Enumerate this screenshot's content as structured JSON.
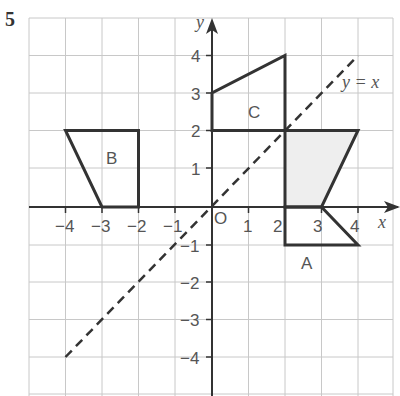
{
  "question_number": "5",
  "diagram": {
    "x_axis_label": "x",
    "y_axis_label": "y",
    "origin_label": "O",
    "x_ticks": [
      "−4",
      "−3",
      "−2",
      "−1",
      "1",
      "2",
      "3",
      "4"
    ],
    "y_ticks": [
      "4",
      "3",
      "2",
      "1",
      "−1",
      "−2",
      "−3",
      "−4"
    ],
    "line_label": "y = x",
    "shapes": [
      {
        "name": "A",
        "vertices": [
          [
            2,
            0
          ],
          [
            3,
            0
          ],
          [
            4,
            -2
          ],
          [
            2,
            -2
          ]
        ]
      },
      {
        "name": "B",
        "vertices": [
          [
            -4,
            2
          ],
          [
            -2,
            2
          ],
          [
            -2,
            0
          ],
          [
            -3,
            0
          ]
        ]
      },
      {
        "name": "C",
        "vertices": [
          [
            0,
            2
          ],
          [
            0,
            3
          ],
          [
            2,
            4
          ],
          [
            2,
            2
          ]
        ]
      },
      {
        "name": "shaded",
        "vertices": [
          [
            2,
            0
          ],
          [
            3,
            0
          ],
          [
            4,
            2
          ],
          [
            2,
            2
          ]
        ],
        "fill": "#eeeeee"
      }
    ],
    "mirror_line": {
      "equation": "y = x",
      "from": [
        -4,
        -4
      ],
      "to": [
        4,
        4
      ],
      "style": "dashed"
    },
    "grid_range": {
      "x": [
        -5,
        5
      ],
      "y": [
        -5,
        5
      ]
    },
    "colors": {
      "grid": "#c8c8c8",
      "axis": "#333333",
      "shape": "#333333",
      "shade": "#eeeeee"
    }
  }
}
